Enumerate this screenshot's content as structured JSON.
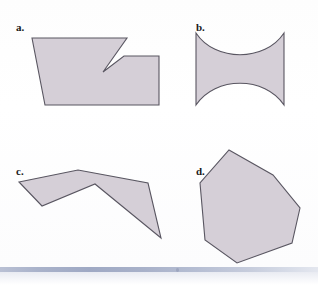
{
  "figure": {
    "page_background": "#fefefe",
    "shape_fill": "#d5cfd7",
    "shape_stroke": "#595661",
    "label_color": "#1a1a1a",
    "footer_accent": "#9fa9c4",
    "panels": [
      {
        "id": "panel-a",
        "label": "a.",
        "label_x": 16,
        "label_y": 22,
        "description": "concave octagon with notch on top right",
        "geometry_type": "polygon",
        "points": "32,38 99,38 127,38 103,72 124,56 159,56 159,105 45,105",
        "vertices": [
          [
            32,
            38
          ],
          [
            99,
            38
          ],
          [
            127,
            38
          ],
          [
            103,
            72
          ],
          [
            124,
            56
          ],
          [
            159,
            56
          ],
          [
            159,
            105
          ],
          [
            45,
            105
          ]
        ],
        "is_convex": false
      },
      {
        "id": "panel-b",
        "label": "b.",
        "label_x": 196,
        "label_y": 22,
        "description": "square with concave circular arcs on top and bottom edges",
        "geometry_type": "path",
        "path": "M 196,33 C 215,62 265,62 284,33 L 284,105 C 265,76 215,76 196,105 Z",
        "corners": [
          [
            196,
            33
          ],
          [
            284,
            33
          ],
          [
            284,
            105
          ],
          [
            196,
            105
          ]
        ],
        "is_convex": false
      },
      {
        "id": "panel-c",
        "label": "c.",
        "label_x": 16,
        "label_y": 166,
        "description": "zigzag concave polygon, bowtie-like double triangle",
        "geometry_type": "polygon",
        "points": "19,182 78,170 148,183 161,238 95,184 42,206",
        "vertices": [
          [
            19,
            182
          ],
          [
            78,
            170
          ],
          [
            148,
            183
          ],
          [
            161,
            238
          ],
          [
            95,
            184
          ],
          [
            42,
            206
          ]
        ],
        "is_convex": false
      },
      {
        "id": "panel-d",
        "label": "d.",
        "label_x": 196,
        "label_y": 166,
        "description": "convex heptagon",
        "geometry_type": "polygon",
        "points": "229,150 273,175 300,208 292,243 237,263 205,240 200,183",
        "vertices": [
          [
            229,
            150
          ],
          [
            273,
            175
          ],
          [
            300,
            208
          ],
          [
            292,
            243
          ],
          [
            237,
            263
          ],
          [
            205,
            240
          ],
          [
            200,
            183
          ]
        ],
        "is_convex": true
      }
    ]
  }
}
